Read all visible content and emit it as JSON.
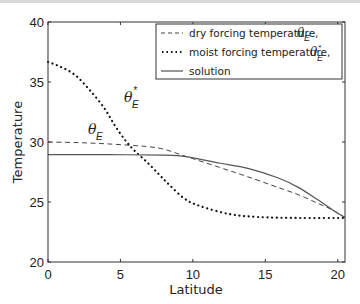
{
  "chart_data": {
    "type": "line",
    "title": "",
    "xlabel": "Latitude",
    "ylabel": "Temperature",
    "xlim": [
      0,
      20.5
    ],
    "ylim": [
      20,
      40
    ],
    "xticks": [
      0,
      5,
      10,
      15,
      20
    ],
    "yticks": [
      20,
      25,
      30,
      35,
      40
    ],
    "grid": false,
    "legend_position": "upper right",
    "legend": [
      {
        "label": "dry forcing temperature, θ_E",
        "style": "dashed"
      },
      {
        "label": "moist forcing temperature, θ*_E",
        "style": "dotted"
      },
      {
        "label": "solution",
        "style": "solid"
      }
    ],
    "series": [
      {
        "name": "dry forcing temperature, θ_E",
        "style": "dashed",
        "x": [
          0,
          2,
          4,
          6,
          7,
          8,
          9.4,
          11.8,
          13.8,
          15.9,
          17.3,
          18.6,
          19.7,
          20.5
        ],
        "y": [
          30.0,
          29.95,
          29.85,
          29.7,
          29.6,
          29.4,
          28.85,
          27.9,
          27.1,
          26.2,
          25.6,
          24.9,
          24.3,
          23.7
        ]
      },
      {
        "name": "moist forcing temperature, θ*_E",
        "style": "dotted",
        "x": [
          0,
          0.8,
          1.85,
          2.9,
          3.9,
          4.6,
          5.3,
          5.95,
          6.85,
          7.7,
          8.4,
          9.4,
          10.4,
          12.5,
          14.5,
          17.3,
          20.5
        ],
        "y": [
          36.67,
          36.3,
          35.6,
          34.3,
          32.8,
          31.4,
          30.2,
          29.3,
          28.3,
          27.25,
          26.4,
          25.3,
          24.7,
          24.0,
          23.75,
          23.67,
          23.67
        ]
      },
      {
        "name": "solution",
        "style": "solid",
        "x": [
          0,
          4,
          8,
          9.4,
          11.8,
          13.8,
          15.9,
          17.3,
          18.6,
          19.7,
          20.5
        ],
        "y": [
          28.95,
          28.95,
          28.9,
          28.8,
          28.25,
          27.8,
          27.0,
          26.2,
          25.2,
          24.3,
          23.7
        ]
      }
    ],
    "annotations": [
      {
        "text": "θ*_E",
        "x": 5.8,
        "y": 33.2,
        "points_to": "moist forcing temperature"
      },
      {
        "text": "θ_E",
        "x": 4.0,
        "y": 30.6,
        "points_to": "dry forcing temperature"
      }
    ]
  },
  "labels": {
    "xlabel": "Latitude",
    "ylabel": "Temperature",
    "legend_dry": "dry forcing temperature,",
    "legend_moist": "moist forcing temperature,",
    "legend_solution": "solution",
    "theta": "θ",
    "sub_E": "E",
    "star": "*"
  }
}
